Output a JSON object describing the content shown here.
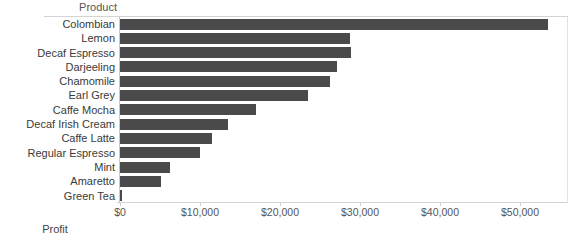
{
  "header": {
    "row_field_label": "Product"
  },
  "axis": {
    "x_title": "Profit",
    "ticks": [
      {
        "label": "$0",
        "value": 0
      },
      {
        "label": "$10,000",
        "value": 10000
      },
      {
        "label": "$20,000",
        "value": 20000
      },
      {
        "label": "$30,000",
        "value": 30000
      },
      {
        "label": "$40,000",
        "value": 40000
      },
      {
        "label": "$50,000",
        "value": 50000
      }
    ]
  },
  "colors": {
    "bar": "#4a4a4a",
    "grid": "#d4d4d4",
    "text": "#3a3a3a",
    "background": "#ffffff"
  },
  "chart_data": {
    "type": "bar",
    "orientation": "horizontal",
    "title": "",
    "subtitle": "",
    "xlabel": "Profit",
    "ylabel": "Product",
    "xlim": [
      0,
      56000
    ],
    "grid": false,
    "legend": false,
    "categories": [
      "Colombian",
      "Lemon",
      "Decaf Espresso",
      "Darjeeling",
      "Chamomile",
      "Earl Grey",
      "Caffe Mocha",
      "Decaf Irish Cream",
      "Caffe Latte",
      "Regular Espresso",
      "Mint",
      "Amaretto",
      "Green Tea"
    ],
    "values": [
      53500,
      28800,
      28900,
      27100,
      26250,
      23500,
      17000,
      13500,
      11500,
      10000,
      6250,
      5100,
      300
    ],
    "tick_labels": [
      "$0",
      "$10,000",
      "$20,000",
      "$30,000",
      "$40,000",
      "$50,000"
    ],
    "tick_values": [
      0,
      10000,
      20000,
      30000,
      40000,
      50000
    ]
  }
}
